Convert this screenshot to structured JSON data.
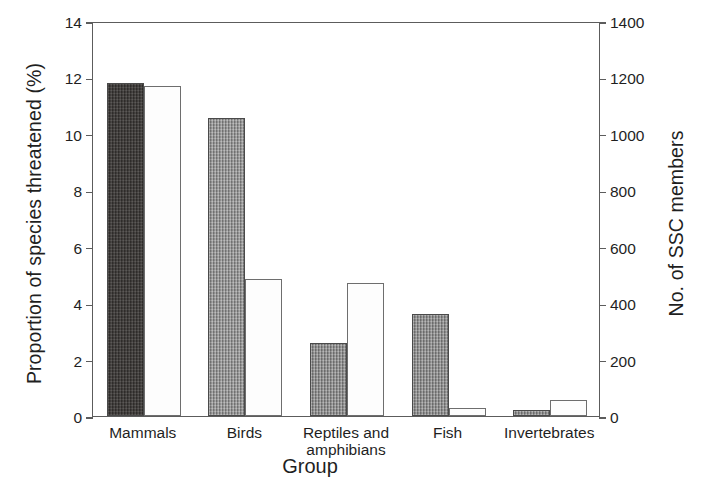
{
  "chart_data": {
    "type": "bar",
    "title": "",
    "subtitle": "",
    "xlabel": "Group",
    "ylabel": "Proportion of species threatened (%)",
    "ylabel_right": "No. of SSC members",
    "categories": [
      "Mammals",
      "Birds",
      "Reptiles and amphibians",
      "Fish",
      "Invertebrates"
    ],
    "category_lines": [
      [
        "Mammals"
      ],
      [
        "Birds"
      ],
      [
        "Reptiles and",
        "amphibians"
      ],
      [
        "Fish"
      ],
      [
        "Invertebrates"
      ]
    ],
    "series": [
      {
        "name": "Proportion of species threatened (%)",
        "axis": "left",
        "fill": "dark-textured",
        "values": [
          11.8,
          10.55,
          2.6,
          3.6,
          0.2
        ]
      },
      {
        "name": "No. of SSC members",
        "axis": "right",
        "fill": "light-stippled",
        "values": [
          1170,
          485,
          470,
          30,
          55
        ]
      }
    ],
    "ylim": [
      0,
      14
    ],
    "yticks": [
      0,
      2,
      4,
      6,
      8,
      10,
      12,
      14
    ],
    "ylim_right": [
      0,
      1400
    ],
    "yticks_right": [
      0,
      200,
      400,
      600,
      800,
      1000,
      1200,
      1400
    ],
    "grid": false,
    "legend": "none",
    "bar_fill_colors": [
      "#3b3836",
      "#8e8e8e",
      "#8b8b8b",
      "#8b8b8b",
      "#8b8b8b"
    ],
    "light_bar_color": "#fdfdfd",
    "axis_color": "#5c5c5c"
  }
}
